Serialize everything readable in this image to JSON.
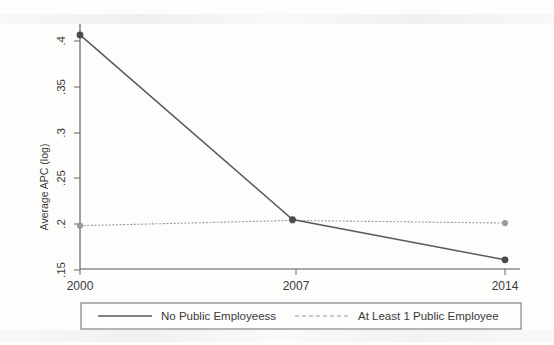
{
  "chart_data": {
    "type": "line",
    "title": "",
    "subtitle": "",
    "xlabel": "",
    "ylabel": "Average APC (log)",
    "x": [
      2000,
      2007,
      2014
    ],
    "xtick_labels": [
      "2000",
      "2007",
      "2014"
    ],
    "xlim": [
      2000,
      2014
    ],
    "ylim": [
      0.1375,
      0.4175
    ],
    "ytick_values": [
      0.15,
      0.2,
      0.25,
      0.3,
      0.35,
      0.4
    ],
    "ytick_labels": [
      ".15",
      ".2",
      ".25",
      ".3",
      ".35",
      ".4"
    ],
    "grid": false,
    "legend_position": "bottom",
    "series": [
      {
        "name": "No Public Employeess",
        "values": [
          0.405,
          0.194,
          0.148
        ],
        "style": "solid",
        "color": "#5a5a5a",
        "marker": "circle"
      },
      {
        "name": "At Least 1 Public Employee",
        "values": [
          0.187,
          0.193,
          0.19
        ],
        "style": "dotted",
        "color": "#9a9a9a",
        "marker": "circle"
      }
    ]
  },
  "axes": {
    "y_title": "Average APC (log)",
    "y_ticks": [
      {
        "label": ".4",
        "value": 0.4
      },
      {
        "label": ".35",
        "value": 0.35
      },
      {
        "label": ".3",
        "value": 0.3
      },
      {
        "label": ".25",
        "value": 0.25
      },
      {
        "label": ".2",
        "value": 0.2
      },
      {
        "label": ".15",
        "value": 0.15
      }
    ],
    "x_ticks": [
      {
        "label": "2000",
        "value": 2000
      },
      {
        "label": "2007",
        "value": 2007
      },
      {
        "label": "2014",
        "value": 2014
      }
    ]
  },
  "legend": {
    "entries": [
      {
        "label": "No Public Employeess",
        "style": "solid",
        "color": "#5a5a5a"
      },
      {
        "label": "At Least 1 Public Employee",
        "style": "dotted",
        "color": "#9a9a9a"
      }
    ]
  },
  "colors": {
    "background": "#fdfdfc",
    "axis": "#555555",
    "series_solid": "#5a5a5a",
    "series_dotted": "#9a9a9a",
    "text": "#3a3a3a"
  }
}
